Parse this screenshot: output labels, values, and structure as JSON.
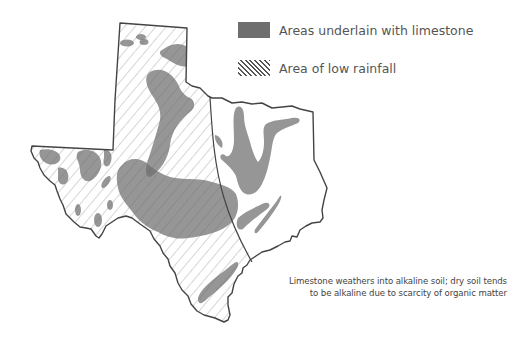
{
  "map": {
    "subject": "Texas",
    "colors": {
      "limestone": "#6e6e6e",
      "outline": "#444444",
      "hatch": "#555555",
      "background": "#ffffff"
    }
  },
  "legend": {
    "items": [
      {
        "label": "Areas underlain with limestone",
        "symbol": "solid-gray-swatch"
      },
      {
        "label": "Area of low rainfall",
        "symbol": "diagonal-hatch-swatch"
      }
    ]
  },
  "caption": {
    "line1": "Limestone weathers into alkaline soil; dry soil tends",
    "line2": "to be alkaline due to scarcity of organic matter"
  }
}
